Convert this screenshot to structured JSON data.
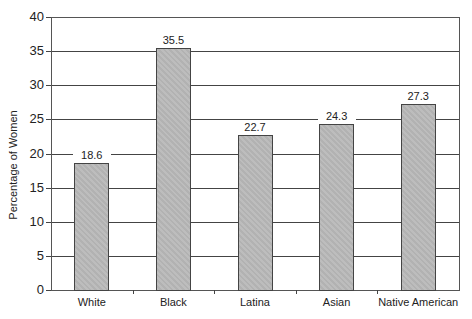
{
  "chart_data": {
    "type": "bar",
    "title": "",
    "xlabel": "",
    "ylabel": "Percentage of Women",
    "categories": [
      "White",
      "Black",
      "Latina",
      "Asian",
      "Native American"
    ],
    "values": [
      18.6,
      35.5,
      22.7,
      24.3,
      27.3
    ],
    "value_labels": [
      "18.6",
      "35.5",
      "22.7",
      "24.3",
      "27.3"
    ],
    "ylim": [
      0,
      40
    ],
    "yticks": [
      0,
      5,
      10,
      15,
      20,
      25,
      30,
      35,
      40
    ],
    "ytick_labels": [
      "0",
      "5",
      "10",
      "15",
      "20",
      "25",
      "30",
      "35",
      "40"
    ],
    "grid": true,
    "legend": null,
    "bar_color": "#b8b8b8",
    "grid_color": "#444444"
  }
}
